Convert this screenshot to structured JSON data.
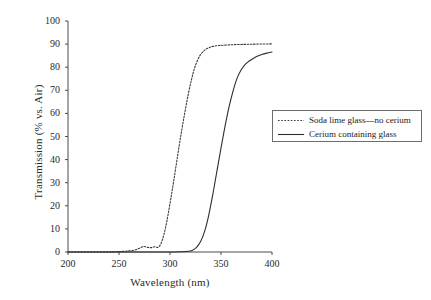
{
  "chart_data": {
    "type": "line",
    "title": "",
    "xlabel": "Wavelength (nm)",
    "ylabel": "Transmission (% vs. Air)",
    "xlim": [
      200,
      400
    ],
    "ylim": [
      0,
      100
    ],
    "xticks": [
      200,
      250,
      300,
      350,
      400
    ],
    "yticks": [
      0,
      10,
      20,
      30,
      40,
      50,
      60,
      70,
      80,
      90,
      100
    ],
    "grid": false,
    "legend_position": "right",
    "series": [
      {
        "name": "Soda lime glass—no cerium",
        "style": "dotted",
        "color": "#3a3a3a",
        "x": [
          200,
          210,
          220,
          230,
          240,
          250,
          255,
          260,
          265,
          270,
          274,
          278,
          282,
          285,
          288,
          291,
          294,
          297,
          300,
          303,
          306,
          309,
          312,
          315,
          318,
          321,
          324,
          327,
          330,
          334,
          338,
          342,
          348,
          356,
          365,
          375,
          385,
          400
        ],
        "y": [
          0,
          0,
          0,
          0,
          0,
          0.2,
          0.3,
          0.5,
          0.8,
          1.6,
          2.4,
          2.0,
          1.9,
          2.3,
          2.0,
          3.5,
          7.5,
          13.5,
          21.0,
          29.0,
          37.5,
          46.0,
          54.0,
          61.5,
          68.5,
          74.5,
          79.5,
          83.0,
          85.5,
          87.4,
          88.4,
          89.0,
          89.4,
          89.6,
          89.8,
          89.9,
          90.0,
          90.1
        ]
      },
      {
        "name": "Cerium containing glass",
        "style": "solid",
        "color": "#2e2e2e",
        "x": [
          200,
          220,
          240,
          260,
          280,
          300,
          310,
          318,
          322,
          326,
          330,
          334,
          338,
          342,
          346,
          350,
          354,
          358,
          362,
          366,
          370,
          374,
          378,
          382,
          386,
          390,
          395,
          400
        ],
        "y": [
          0,
          0,
          0,
          0,
          0,
          0,
          0.1,
          0.3,
          0.8,
          2.0,
          4.5,
          9.0,
          16.0,
          25.0,
          35.0,
          45.0,
          54.5,
          63.0,
          70.0,
          75.5,
          79.0,
          81.3,
          82.8,
          83.9,
          84.8,
          85.5,
          86.1,
          86.6
        ]
      }
    ]
  },
  "legend": {
    "items": [
      {
        "label": "Soda lime glass—no cerium",
        "style": "dotted"
      },
      {
        "label": "Cerium containing glass",
        "style": "solid"
      }
    ]
  },
  "axes": {
    "x_title": "Wavelength (nm)",
    "y_title": "Transmission (% vs. Air)",
    "x_tick_labels": [
      "200",
      "250",
      "300",
      "350",
      "400"
    ],
    "y_tick_labels": [
      "0",
      "10",
      "20",
      "30",
      "40",
      "50",
      "60",
      "70",
      "80",
      "90",
      "100"
    ]
  },
  "colors": {
    "axis": "#4a4a4a",
    "text": "#1a1a1a",
    "series_dotted": "#3a3a3a",
    "series_solid": "#2e2e2e",
    "legend_border": "#6d6d6d",
    "background": "#ffffff"
  }
}
